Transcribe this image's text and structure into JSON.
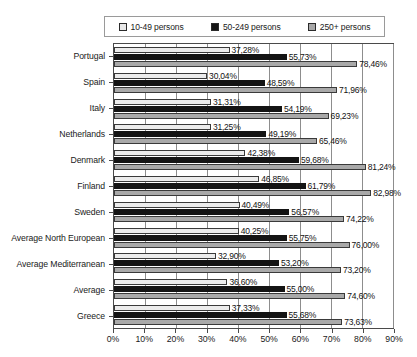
{
  "chart_data": {
    "type": "bar",
    "orientation": "horizontal",
    "title": "",
    "xlabel": "",
    "ylabel": "",
    "xlim": [
      0,
      90
    ],
    "grid": true,
    "legend_position": "top",
    "xticks": [
      "0%",
      "10%",
      "20%",
      "30%",
      "40%",
      "50%",
      "60%",
      "70%",
      "80%",
      "90%"
    ],
    "xtick_values": [
      0,
      10,
      20,
      30,
      40,
      50,
      60,
      70,
      80,
      90
    ],
    "categories": [
      "Portugal",
      "Spain",
      "Italy",
      "Netherlands",
      "Denmark",
      "Finland",
      "Sweden",
      "Average North European",
      "Average Mediterranean",
      "Average",
      "Greece"
    ],
    "series": [
      {
        "name": "10-49 persons",
        "color": "#ececec",
        "values": [
          37.28,
          30.04,
          31.31,
          31.25,
          42.38,
          46.85,
          40.49,
          40.25,
          32.9,
          36.6,
          37.33
        ],
        "labels": [
          "37,28%",
          "30,04%",
          "31,31%",
          "31,25%",
          "42,38%",
          "46,85%",
          "40,49%",
          "40,25%",
          "32,90%",
          "36,60%",
          "37,33%"
        ]
      },
      {
        "name": "50-249 persons",
        "color": "#141414",
        "values": [
          55.73,
          48.59,
          54.19,
          49.19,
          59.68,
          61.79,
          56.57,
          55.75,
          53.2,
          55.0,
          55.68
        ],
        "labels": [
          "55,73%",
          "48,59%",
          "54,19%",
          "49,19%",
          "59,68%",
          "61,79%",
          "56,57%",
          "55,75%",
          "53,20%",
          "55,00%",
          "55,68%"
        ]
      },
      {
        "name": "250+ persons",
        "color": "#a9a9a9",
        "values": [
          78.46,
          71.96,
          69.23,
          65.46,
          81.24,
          82.98,
          74.22,
          76.0,
          73.2,
          74.6,
          73.63
        ],
        "labels": [
          "78,46%",
          "71,96%",
          "69,23%",
          "65,46%",
          "81,24%",
          "82,98%",
          "74,22%",
          "76,00%",
          "73,20%",
          "74,60%",
          "73,63%"
        ]
      }
    ]
  },
  "legend": {
    "items": [
      {
        "label": "10-49 persons",
        "swatch": "legend-swatch-light"
      },
      {
        "label": "50-249 persons",
        "swatch": "legend-swatch-dark"
      },
      {
        "label": "250+ persons",
        "swatch": "legend-swatch-mid"
      }
    ]
  }
}
